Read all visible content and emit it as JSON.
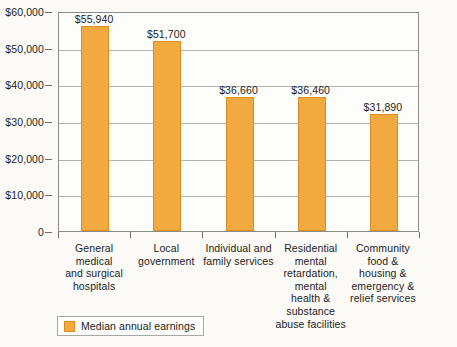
{
  "chart_data": {
    "type": "bar",
    "title": "",
    "xlabel": "",
    "ylabel": "",
    "ylim": [
      0,
      60000
    ],
    "grid": true,
    "legend_position": "bottom-left",
    "categories": [
      "General medical and surgical hospitals",
      "Local government",
      "Individual and family services",
      "Residential mental retardation, mental health & substance abuse facilities",
      "Community food & housing & emergency & relief services"
    ],
    "category_lines": [
      [
        "General medical",
        "and surgical",
        "hospitals"
      ],
      [
        "Local",
        "government"
      ],
      [
        "Individual and",
        "family services"
      ],
      [
        "Residential",
        "mental",
        "retardation,",
        "mental",
        "health &",
        "substance",
        "abuse facilities"
      ],
      [
        "Community",
        "food &",
        "housing &",
        "emergency &",
        "relief services"
      ]
    ],
    "values": [
      55940,
      51700,
      36660,
      36460,
      31890
    ],
    "value_labels": [
      "$55,940",
      "$51,700",
      "$36,660",
      "$36,460",
      "$31,890"
    ],
    "y_ticks": [
      0,
      10000,
      20000,
      30000,
      40000,
      50000,
      60000
    ],
    "y_tick_labels": [
      "0",
      "$10,000",
      "$20,000",
      "$30,000",
      "$40,000",
      "$50,000",
      "$60,000"
    ],
    "series": [
      {
        "name": "Median annual earnings",
        "values": [
          55940,
          51700,
          36660,
          36460,
          31890
        ],
        "color": "#f2a93f"
      }
    ]
  },
  "legend": {
    "label": "Median annual earnings",
    "swatch_color": "#f2a93f"
  },
  "colors": {
    "bar_fill": "#f2a93f",
    "bar_border": "#d98f22",
    "gridline": "#b2b2ad",
    "axis": "#8b8b86",
    "text": "#232323",
    "background": "#fbfaf7"
  }
}
